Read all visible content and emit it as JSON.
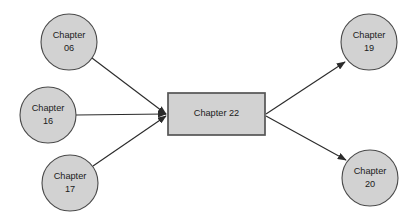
{
  "diagram": {
    "background_color": "#ffffff",
    "node_fill_color": "#d2d2d2",
    "node_stroke_color": "#4a4a4a",
    "edge_color": "#2b2b2b",
    "text_color": "#1a1a1a",
    "nodes": [
      {
        "id": "chapter-06",
        "shape": "circle",
        "label_line1": "Chapter",
        "label_line2": "06",
        "cx": 69,
        "cy": 42,
        "r": 28,
        "role": "source"
      },
      {
        "id": "chapter-16",
        "shape": "circle",
        "label_line1": "Chapter",
        "label_line2": "16",
        "cx": 48,
        "cy": 115,
        "r": 28,
        "role": "source"
      },
      {
        "id": "chapter-17",
        "shape": "circle",
        "label_line1": "Chapter",
        "label_line2": "17",
        "cx": 70,
        "cy": 183,
        "r": 28,
        "role": "source"
      },
      {
        "id": "chapter-22",
        "shape": "rectangle",
        "label_line1": "Chapter 22",
        "label_line2": "",
        "x": 168,
        "y": 93,
        "width": 97,
        "height": 42,
        "role": "center"
      },
      {
        "id": "chapter-19",
        "shape": "circle",
        "label_line1": "Chapter",
        "label_line2": "19",
        "cx": 369,
        "cy": 42,
        "r": 28,
        "role": "target"
      },
      {
        "id": "chapter-20",
        "shape": "circle",
        "label_line1": "Chapter",
        "label_line2": "20",
        "cx": 370,
        "cy": 178,
        "r": 28,
        "role": "target"
      }
    ],
    "edges": [
      {
        "id": "edge-06-to-22",
        "from": "chapter-06",
        "to": "chapter-22",
        "x1": 92,
        "y1": 58,
        "x2": 166,
        "y2": 114
      },
      {
        "id": "edge-16-to-22",
        "from": "chapter-16",
        "to": "chapter-22",
        "x1": 76,
        "y1": 115,
        "x2": 166,
        "y2": 114
      },
      {
        "id": "edge-17-to-22",
        "from": "chapter-17",
        "to": "chapter-22",
        "x1": 93,
        "y1": 166,
        "x2": 166,
        "y2": 116
      },
      {
        "id": "edge-22-to-19",
        "from": "chapter-22",
        "to": "chapter-19",
        "x1": 266,
        "y1": 114,
        "x2": 345,
        "y2": 62
      },
      {
        "id": "edge-22-to-20",
        "from": "chapter-22",
        "to": "chapter-20",
        "x1": 266,
        "y1": 116,
        "x2": 346,
        "y2": 160
      }
    ]
  }
}
